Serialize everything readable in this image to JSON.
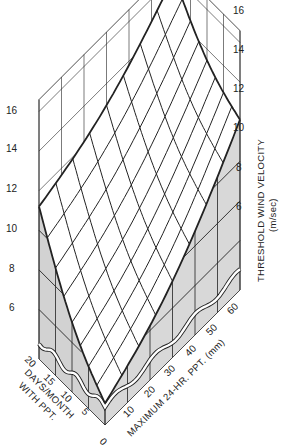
{
  "chart_data": {
    "type": "surface3d",
    "title": "",
    "x_axis": {
      "label": "DAYS/MONTH WITH PPT.",
      "ticks": [
        0,
        5,
        10,
        15,
        20
      ]
    },
    "y_axis": {
      "label": "MAXIMUM 24-HR. PPT. (mm)",
      "ticks": [
        0,
        10,
        20,
        30,
        40,
        50,
        60
      ]
    },
    "z_axis": {
      "label": "THRESHOLD WIND VELOCITY",
      "unit": "(m/sec)",
      "ticks_left": [
        6,
        8,
        10,
        12,
        14,
        16
      ],
      "ticks_right": [
        6,
        8,
        10,
        12,
        14,
        16
      ],
      "range": [
        4,
        16
      ],
      "broken_axis": true
    },
    "surface_corners": {
      "days0_ppt0": 4.6,
      "days20_ppt0": 11.2,
      "days0_ppt60": 12.1,
      "days20_ppt60": 16.0
    },
    "series": [
      {
        "name": "ppt=0 edge (days 0..20)",
        "x": [
          0,
          5,
          10,
          15,
          20
        ],
        "values": [
          4.6,
          5.3,
          6.7,
          8.6,
          11.2
        ]
      },
      {
        "name": "days=0 edge (ppt 0..60)",
        "x": [
          0,
          10,
          20,
          30,
          40,
          50,
          60
        ],
        "values": [
          4.6,
          5.1,
          5.8,
          6.8,
          8.2,
          9.9,
          12.1
        ]
      },
      {
        "name": "days=20 edge (ppt 0..60)",
        "x": [
          0,
          10,
          20,
          30,
          40,
          50,
          60
        ],
        "values": [
          11.2,
          11.6,
          12.2,
          12.9,
          13.8,
          14.8,
          16.0
        ]
      }
    ]
  },
  "labels": {
    "left_ticks": [
      "6",
      "8",
      "10",
      "12",
      "14",
      "16"
    ],
    "right_ticks": [
      "6",
      "8",
      "10",
      "12",
      "14",
      "16"
    ],
    "days_ticks": [
      "0",
      "5",
      "10",
      "15",
      "20"
    ],
    "ppt_ticks": [
      "10",
      "20",
      "30",
      "40",
      "50",
      "60"
    ],
    "days_title_1": "DAYS/MONTH",
    "days_title_2": "WITH PPT.",
    "ppt_title": "MAXIMUM 24-HR. PPT. (mm)",
    "z_title": "THRESHOLD WIND VELOCITY",
    "z_unit": "(m/sec)"
  }
}
